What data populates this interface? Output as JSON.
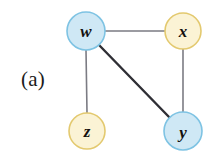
{
  "figure": {
    "panel_label": "(a)",
    "background_color": "#ffffff"
  },
  "graph": {
    "nodes": [
      {
        "id": "w",
        "label": "w",
        "cx": 86,
        "cy": 31,
        "r": 19,
        "fill": "#cfe8f5",
        "stroke": "#7ec3e3",
        "color_name": "blue"
      },
      {
        "id": "x",
        "label": "x",
        "cx": 183,
        "cy": 31,
        "r": 18,
        "fill": "#fbf3d5",
        "stroke": "#e3c96f",
        "color_name": "yellow"
      },
      {
        "id": "z",
        "label": "z",
        "cx": 87,
        "cy": 131,
        "r": 18,
        "fill": "#fbf3d5",
        "stroke": "#e3c96f",
        "color_name": "yellow"
      },
      {
        "id": "y",
        "label": "y",
        "cx": 183,
        "cy": 131,
        "r": 19,
        "fill": "#cfe8f5",
        "stroke": "#7ec3e3",
        "color_name": "blue"
      }
    ],
    "edges": [
      {
        "id": "w-x",
        "source": "w",
        "target": "x",
        "stroke": "#7b7b83",
        "width": 1.6,
        "emphasis": "normal"
      },
      {
        "id": "w-z",
        "source": "w",
        "target": "z",
        "stroke": "#7b7b83",
        "width": 1.6,
        "emphasis": "normal"
      },
      {
        "id": "x-y",
        "source": "x",
        "target": "y",
        "stroke": "#7b7b83",
        "width": 1.6,
        "emphasis": "normal"
      },
      {
        "id": "w-y",
        "source": "w",
        "target": "y",
        "stroke": "#2f2f35",
        "width": 2.4,
        "emphasis": "bold"
      }
    ]
  }
}
